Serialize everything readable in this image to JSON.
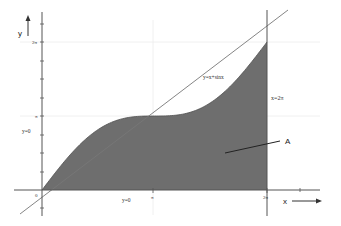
{
  "diagram": {
    "colors": {
      "fill": "#6e6e6e",
      "axis": "#555555",
      "gridline": "#e8e8e8",
      "text": "#333333"
    },
    "axes": {
      "x_label": "x",
      "y_label": "y",
      "x_ticks": [
        {
          "label": "0",
          "value": 0
        },
        {
          "label": "π",
          "value": 3.14159
        },
        {
          "label": "2π",
          "value": 6.28318
        }
      ],
      "y_ticks": [
        {
          "label": "π",
          "value": 3.14159
        },
        {
          "label": "2π",
          "value": 6.28318
        }
      ]
    },
    "labels": {
      "curve": "y=x+sinx",
      "vertical_line": "x=2π",
      "y_zero_left": "y=0",
      "y_zero_bottom": "y=0",
      "region": "A",
      "origin": "0"
    }
  }
}
